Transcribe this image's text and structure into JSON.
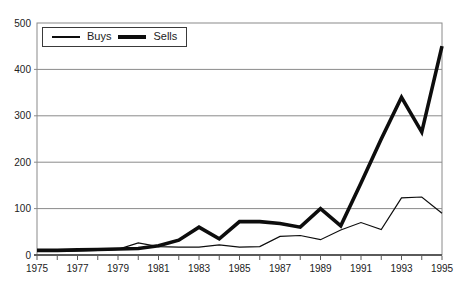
{
  "window": {
    "width": 470,
    "height": 288
  },
  "chart_data": {
    "type": "line",
    "title": "",
    "xlabel": "",
    "ylabel": "",
    "x": [
      1975,
      1976,
      1977,
      1978,
      1979,
      1980,
      1981,
      1982,
      1983,
      1984,
      1985,
      1986,
      1987,
      1988,
      1989,
      1990,
      1991,
      1992,
      1993,
      1994,
      1995
    ],
    "x_tick_labels": [
      "1975",
      "1977",
      "1979",
      "1981",
      "1983",
      "1985",
      "1987",
      "1989",
      "1991",
      "1993",
      "1995"
    ],
    "y_tick_labels": [
      "0",
      "100",
      "200",
      "300",
      "400",
      "500"
    ],
    "xlim": [
      1975,
      1995
    ],
    "ylim": [
      0,
      500
    ],
    "y_tick_interval": 100,
    "grid": "horizontal-only",
    "legend_position": "top-left-inside",
    "series": [
      {
        "name": "Buys",
        "line_style": "thin",
        "values": [
          8,
          8,
          9,
          10,
          12,
          26,
          18,
          17,
          17,
          22,
          17,
          18,
          40,
          42,
          33,
          54,
          70,
          55,
          123,
          125,
          90
        ]
      },
      {
        "name": "Sells",
        "line_style": "thick",
        "values": [
          10,
          10,
          11,
          12,
          13,
          14,
          20,
          32,
          60,
          35,
          72,
          72,
          68,
          60,
          100,
          63,
          155,
          250,
          340,
          265,
          450
        ]
      }
    ],
    "colors": {
      "series_line": "#0d0d0d",
      "grid_line": "#8a8a8a",
      "axis_line": "#5a5a5a",
      "tick_text": "#222222",
      "background": "#ffffff"
    }
  }
}
